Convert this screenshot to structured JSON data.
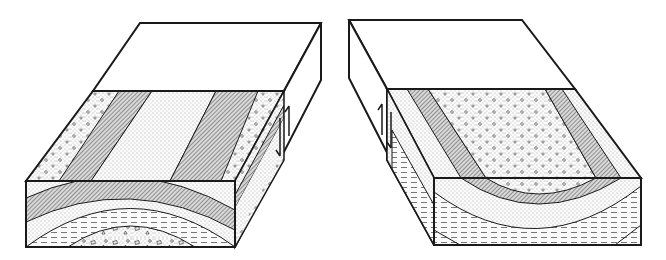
{
  "figure": {
    "title": "Eroded fold block diagrams with faults",
    "panels": [
      {
        "id": "left",
        "structure": "anticline",
        "fault_arrows": "up-down (left block raised)",
        "layers_outer_to_core": [
          "dotted-sandstone",
          "hatched",
          "fine-sand",
          "dashed-shale",
          "breccia-core"
        ]
      },
      {
        "id": "right",
        "structure": "syncline",
        "fault_arrows": "up-down (left block raised)",
        "layers_outer_to_core": [
          "dashed-shale",
          "fine-sand",
          "hatched",
          "dotted-sandstone-core"
        ]
      }
    ]
  },
  "colors": {
    "stroke": "#1a1a1a",
    "background": "#ffffff",
    "fill_light": "#f2f2f2",
    "fill_hatch": "#9a9a9a"
  }
}
